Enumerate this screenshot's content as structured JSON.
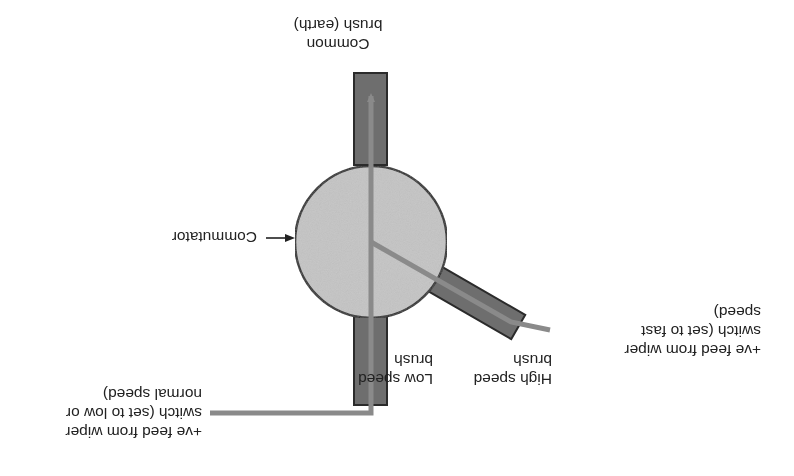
{
  "orientation": "rotated-180",
  "colors": {
    "brush_fill": "#6e6e6e",
    "brush_stroke": "#2b2b2b",
    "commutator_fill": "#c4c4c4",
    "commutator_stroke": "#2b2b2b",
    "wire": "#8a8a8a",
    "text": "#222222"
  },
  "labels": {
    "common_brush": [
      "Common",
      "brush (earth)"
    ],
    "commutator": "Commutator",
    "low_speed_brush": [
      "Low speed",
      "brush"
    ],
    "high_speed_brush": [
      "High speed",
      "brush"
    ],
    "low_feed": [
      "+ve feed from wiper",
      "switch (set to low or",
      "normal speed)"
    ],
    "high_feed": [
      "+ve feed from wiper",
      "switch (set to fast",
      "speed)"
    ]
  }
}
